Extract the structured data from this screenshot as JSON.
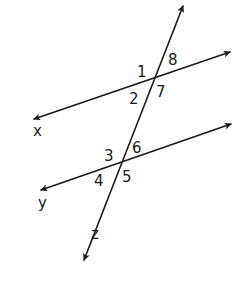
{
  "diagram": {
    "lines": [
      {
        "name": "x",
        "label": "x",
        "from": [
          34,
          119
        ],
        "to": [
          230,
          52
        ],
        "arrows": "both"
      },
      {
        "name": "y",
        "label": "y",
        "from": [
          41,
          190
        ],
        "to": [
          231,
          124
        ],
        "arrows": "both"
      },
      {
        "name": "z",
        "label": "z",
        "from": [
          84,
          260
        ],
        "to": [
          183,
          6
        ],
        "arrows": "both"
      }
    ],
    "line_labels": {
      "x": "x",
      "y": "y",
      "z": "z"
    },
    "intersections": [
      {
        "lines": [
          "x",
          "z"
        ],
        "point": [
          153,
          79
        ],
        "angles": [
          "1",
          "8",
          "7",
          "2"
        ]
      },
      {
        "lines": [
          "y",
          "z"
        ],
        "point": [
          120,
          163
        ],
        "angles": [
          "3",
          "6",
          "5",
          "4"
        ]
      }
    ],
    "angle_labels": {
      "a1": "1",
      "a2": "2",
      "a3": "3",
      "a4": "4",
      "a5": "5",
      "a6": "6",
      "a7": "7",
      "a8": "8"
    },
    "colors": {
      "stroke": "#1a1a1a",
      "background": "#ffffff"
    }
  }
}
